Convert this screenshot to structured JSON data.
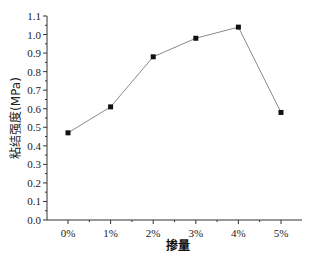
{
  "chart_data": {
    "type": "line",
    "title": "",
    "xlabel": "掺量",
    "ylabel": "粘结强度(MPa)",
    "categories": [
      "0%",
      "1%",
      "2%",
      "3%",
      "4%",
      "5%"
    ],
    "series": [
      {
        "name": "粘结强度",
        "values": [
          0.47,
          0.61,
          0.88,
          0.98,
          1.04,
          0.58
        ],
        "marker": "square",
        "line_color": "#8a8a8a",
        "marker_color": "#111111"
      }
    ],
    "ylim": [
      0.0,
      1.1
    ],
    "yticks": [
      "0.0",
      "0.1",
      "0.2",
      "0.3",
      "0.4",
      "0.5",
      "0.6",
      "0.7",
      "0.8",
      "0.9",
      "1.0",
      "1.1"
    ],
    "grid": false,
    "legend": "none"
  }
}
